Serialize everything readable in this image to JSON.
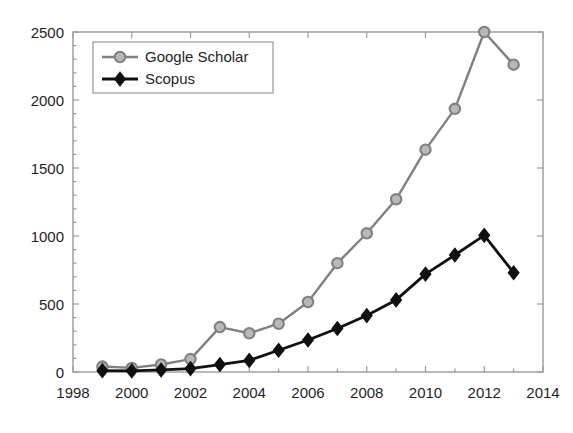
{
  "chart_data": {
    "type": "line",
    "title": "",
    "subtitle": "",
    "xlabel": "",
    "ylabel": "",
    "x": [
      1999,
      2000,
      2001,
      2002,
      2003,
      2004,
      2005,
      2006,
      2007,
      2008,
      2009,
      2010,
      2011,
      2012,
      2013
    ],
    "xlim": [
      1998,
      2014
    ],
    "ylim": [
      0,
      2500
    ],
    "xticks": [
      1998,
      2000,
      2002,
      2004,
      2006,
      2008,
      2010,
      2012,
      2014
    ],
    "xtick_labels": [
      "1998",
      "2000",
      "2002",
      "2004",
      "2006",
      "2008",
      "2010",
      "2012",
      "2014"
    ],
    "yticks": [
      0,
      500,
      1000,
      1500,
      2000,
      2500
    ],
    "ytick_labels": [
      "0",
      "500",
      "1000",
      "1500",
      "2000",
      "2500"
    ],
    "grid": false,
    "legend_position": "top-left",
    "series": [
      {
        "name": "Google Scholar",
        "color": "#808080",
        "marker": "circle",
        "values": [
          40,
          30,
          55,
          95,
          330,
          285,
          355,
          515,
          800,
          1020,
          1270,
          1635,
          1935,
          2500,
          2260
        ]
      },
      {
        "name": "Scopus",
        "color": "#101010",
        "marker": "diamond",
        "values": [
          10,
          8,
          15,
          25,
          55,
          85,
          160,
          235,
          320,
          415,
          530,
          720,
          860,
          1005,
          730
        ]
      }
    ]
  },
  "legend": {
    "entries": [
      {
        "label": "Google Scholar"
      },
      {
        "label": "Scopus"
      }
    ]
  },
  "axes": {
    "x_axis_name": "year-axis",
    "y_axis_name": "count-axis"
  }
}
